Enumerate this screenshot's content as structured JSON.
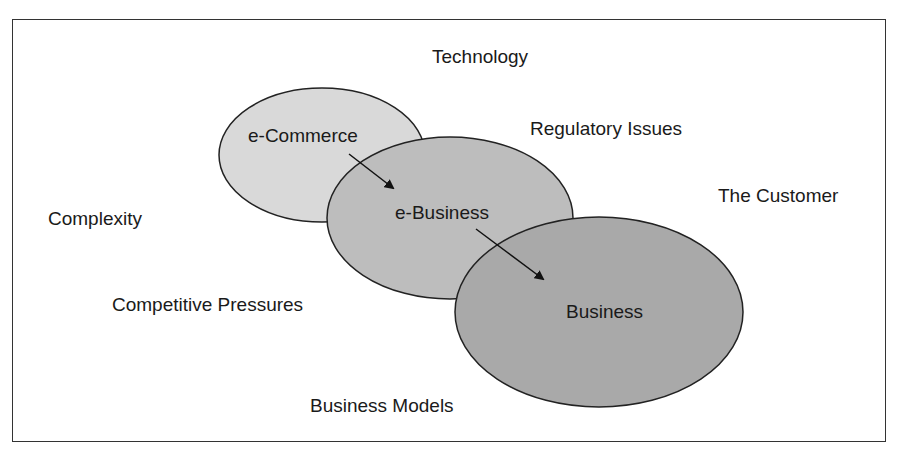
{
  "diagram": {
    "ellipses": [
      {
        "id": "ecommerce",
        "label": "e-Commerce",
        "cx": 322,
        "cy": 155,
        "rx": 103,
        "ry": 67,
        "fill": "#d9d9d9"
      },
      {
        "id": "ebusiness",
        "label": "e-Business",
        "cx": 450,
        "cy": 218,
        "rx": 123,
        "ry": 81,
        "fill": "#bdbdbd"
      },
      {
        "id": "business",
        "label": "Business",
        "cx": 599,
        "cy": 312,
        "rx": 144,
        "ry": 95,
        "fill": "#a9a9a9"
      }
    ],
    "arrows": [
      {
        "from": "ecommerce",
        "to": "ebusiness"
      },
      {
        "from": "ebusiness",
        "to": "business"
      }
    ],
    "factors": {
      "technology": "Technology",
      "regulatory": "Regulatory Issues",
      "customer": "The Customer",
      "complexity": "Complexity",
      "competitive": "Competitive Pressures",
      "models": "Business Models"
    }
  }
}
